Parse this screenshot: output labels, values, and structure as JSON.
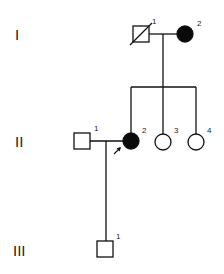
{
  "diagram": {
    "type": "pedigree",
    "generations": [
      {
        "roman": "I"
      },
      {
        "roman": "II"
      },
      {
        "roman": "III"
      }
    ],
    "individuals": [
      {
        "id": "I-1",
        "number": "1",
        "generation": "I",
        "sex": "male",
        "affected": false,
        "deceased": true
      },
      {
        "id": "I-2",
        "number": "2",
        "generation": "I",
        "sex": "female",
        "affected": true,
        "deceased": false
      },
      {
        "id": "II-1",
        "number": "1",
        "generation": "II",
        "sex": "male",
        "affected": false,
        "deceased": false
      },
      {
        "id": "II-2",
        "number": "2",
        "generation": "II",
        "sex": "female",
        "affected": true,
        "deceased": false,
        "proband": true
      },
      {
        "id": "II-3",
        "number": "3",
        "generation": "II",
        "sex": "female",
        "affected": false,
        "deceased": false
      },
      {
        "id": "II-4",
        "number": "4",
        "generation": "II",
        "sex": "female",
        "affected": false,
        "deceased": false
      },
      {
        "id": "III-1",
        "number": "1",
        "generation": "III",
        "sex": "male",
        "affected": false,
        "deceased": false
      }
    ],
    "relationships": [
      {
        "partners": [
          "I-1",
          "I-2"
        ],
        "children": [
          "II-2",
          "II-3",
          "II-4"
        ]
      },
      {
        "partners": [
          "II-1",
          "II-2"
        ],
        "children": [
          "III-1"
        ]
      }
    ],
    "colors": {
      "line": "#111111",
      "affected": "#0a0a0a",
      "unaffected": "#ffffff"
    }
  }
}
